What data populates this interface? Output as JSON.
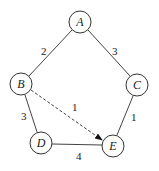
{
  "nodes": [
    {
      "id": "A",
      "label": "A",
      "x": 80,
      "y": 22
    },
    {
      "id": "B",
      "label": "B",
      "x": 21,
      "y": 84
    },
    {
      "id": "C",
      "label": "C",
      "x": 137,
      "y": 85
    },
    {
      "id": "D",
      "label": "D",
      "x": 41,
      "y": 143
    },
    {
      "id": "E",
      "label": "E",
      "x": 113,
      "y": 146
    }
  ],
  "edges": [
    {
      "from": "A",
      "to": "B",
      "weight": "2",
      "style": "solid"
    },
    {
      "from": "A",
      "to": "C",
      "weight": "3",
      "style": "solid"
    },
    {
      "from": "B",
      "to": "D",
      "weight": "3",
      "style": "solid"
    },
    {
      "from": "C",
      "to": "E",
      "weight": "1",
      "style": "solid"
    },
    {
      "from": "D",
      "to": "E",
      "weight": "4",
      "style": "solid"
    },
    {
      "from": "B",
      "to": "E",
      "weight": "1",
      "style": "dashed-arrow"
    }
  ]
}
